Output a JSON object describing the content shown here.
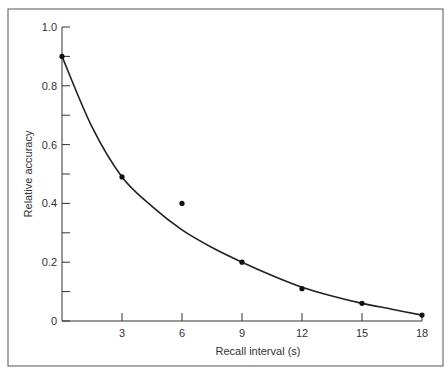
{
  "chart_data": {
    "type": "scatter",
    "title": "",
    "xlabel": "Recall interval (s)",
    "ylabel": "Relative accuracy",
    "xlim": [
      0,
      18
    ],
    "ylim": [
      0,
      1.0
    ],
    "x_ticks": [
      3,
      6,
      9,
      12,
      15,
      18
    ],
    "y_ticks": [
      0,
      0.2,
      0.4,
      0.6,
      0.8,
      1.0
    ],
    "y_tick_labels": [
      "0",
      "0.2",
      "0.4",
      "0.6",
      "0.8",
      "1.0"
    ],
    "grid": false,
    "legend": null,
    "series": [
      {
        "name": "Observed",
        "type": "scatter",
        "x": [
          0,
          3,
          6,
          9,
          12,
          15,
          18
        ],
        "y": [
          0.9,
          0.49,
          0.4,
          0.2,
          0.11,
          0.06,
          0.02
        ]
      },
      {
        "name": "Fitted curve",
        "type": "line",
        "x": [
          0,
          1.5,
          3,
          4.5,
          6,
          7.5,
          9,
          10.5,
          12,
          13.5,
          15,
          16.5,
          18
        ],
        "y": [
          0.9,
          0.66,
          0.49,
          0.39,
          0.31,
          0.25,
          0.2,
          0.155,
          0.115,
          0.085,
          0.06,
          0.04,
          0.02
        ]
      }
    ]
  }
}
